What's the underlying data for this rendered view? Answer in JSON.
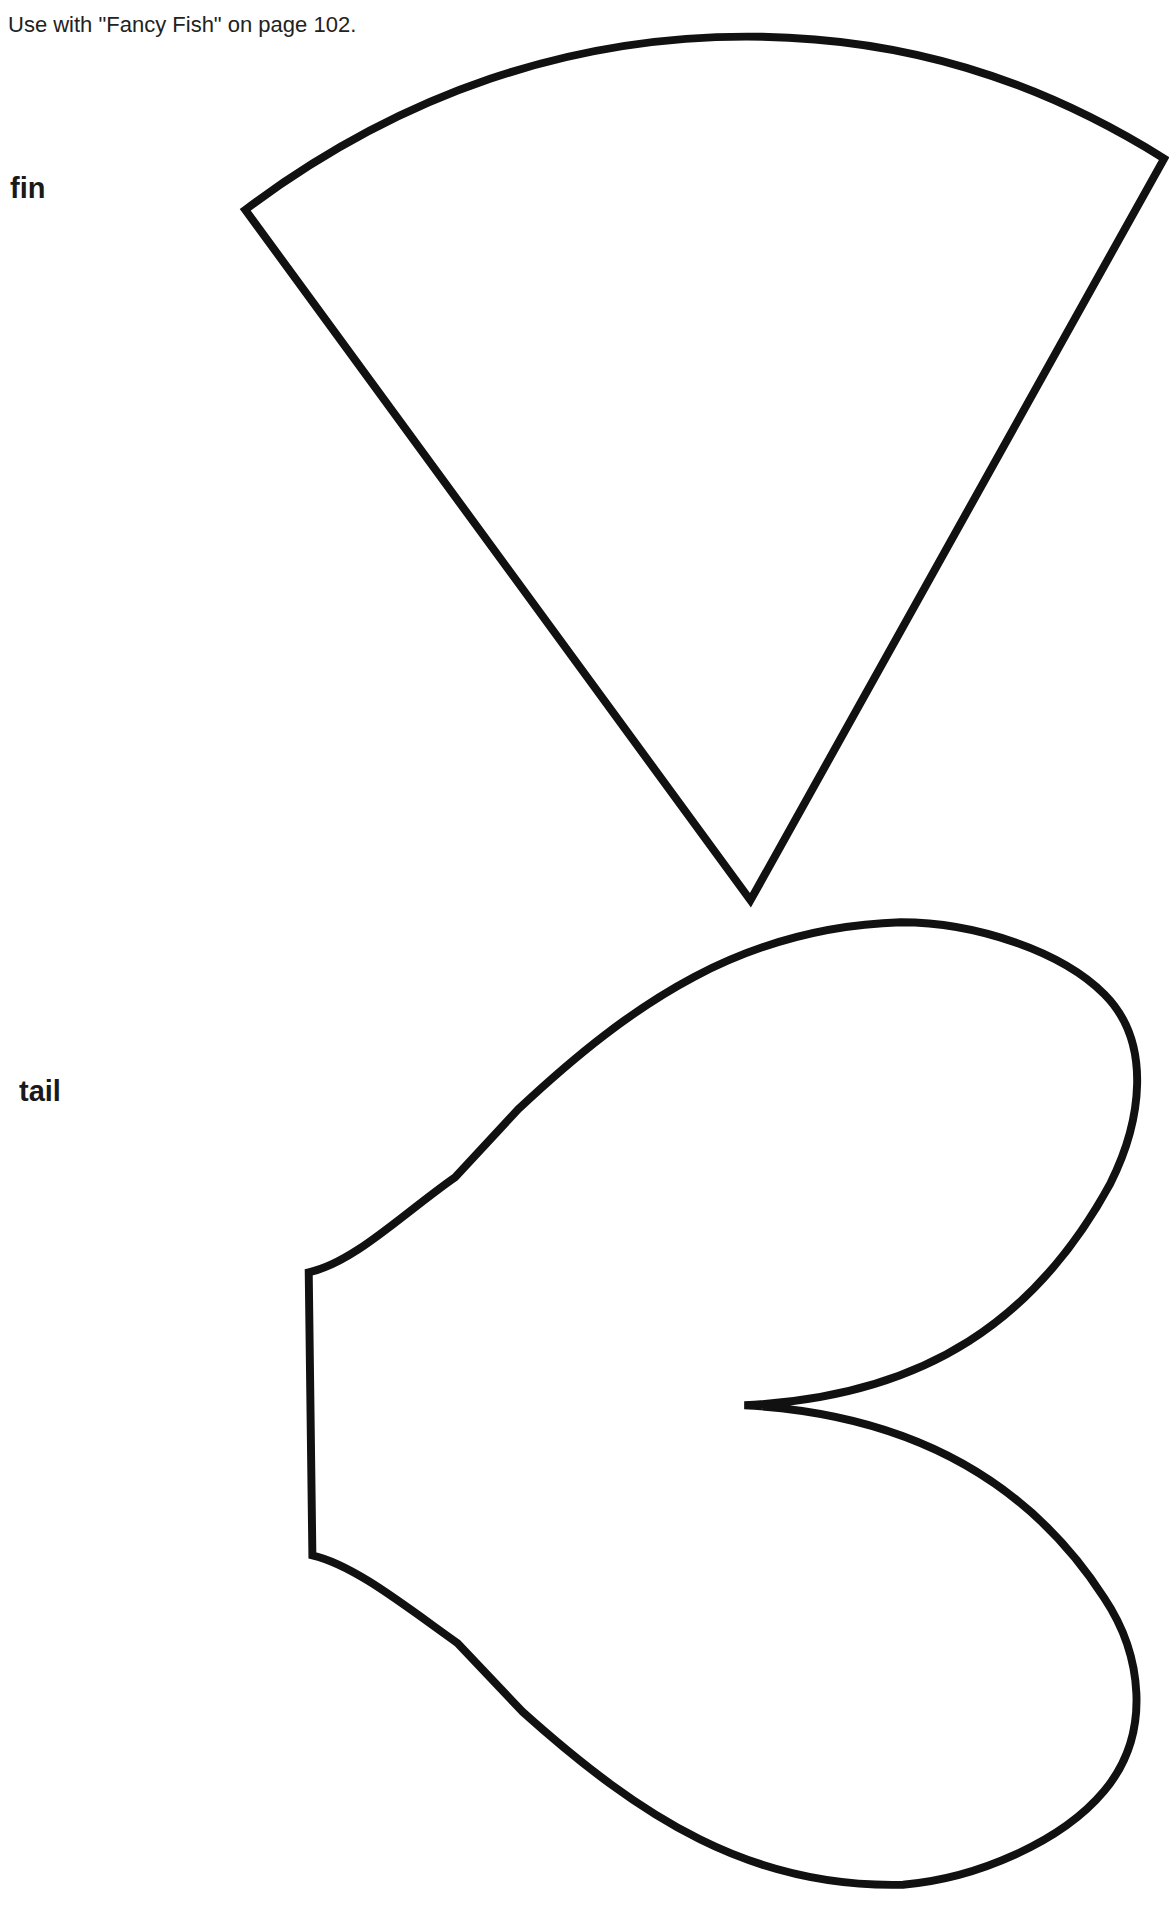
{
  "page": {
    "header_note": "Use with \"Fancy Fish\" on page 102.",
    "shapes": [
      {
        "id": "fin",
        "label": "fin",
        "icon": "fin-outline-icon"
      },
      {
        "id": "tail",
        "label": "tail",
        "icon": "tail-outline-icon"
      }
    ],
    "colors": {
      "background": "#ffffff",
      "outline": "#111111",
      "text": "#222222"
    }
  }
}
